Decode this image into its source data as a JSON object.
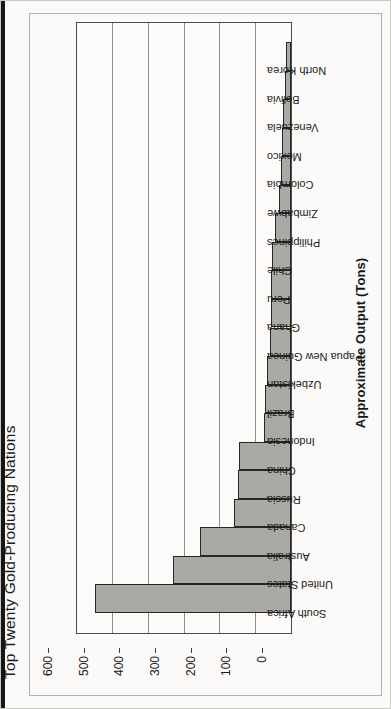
{
  "chart_data": {
    "type": "bar",
    "title": "Top Twenty Gold-Producing Nations",
    "xlabel": "Approximate Output (Tons)",
    "ylabel": "",
    "categories": [
      "South Africa",
      "United States",
      "Australia",
      "Canada",
      "Russia",
      "China",
      "Indonesia",
      "Brazil",
      "Uzbekistan",
      "Papua New Guinea",
      "Ghana",
      "Peru",
      "Chile",
      "Philippines",
      "Zimbabwe",
      "Colombia",
      "Mexico",
      "Venezuela",
      "Bolivia",
      "North Korea"
    ],
    "values": [
      550,
      330,
      255,
      160,
      150,
      145,
      75,
      72,
      67,
      60,
      57,
      56,
      54,
      45,
      34,
      29,
      25,
      22,
      18,
      15
    ],
    "ylim": [
      0,
      600
    ],
    "yticks": [
      0,
      100,
      200,
      300,
      400,
      500,
      600
    ],
    "grid": true,
    "legend": "none",
    "rotation_deg": -90,
    "bar_color": "#aaa9a6",
    "bar_border_color": "#272725",
    "grid_color": "#8f8f8c"
  }
}
